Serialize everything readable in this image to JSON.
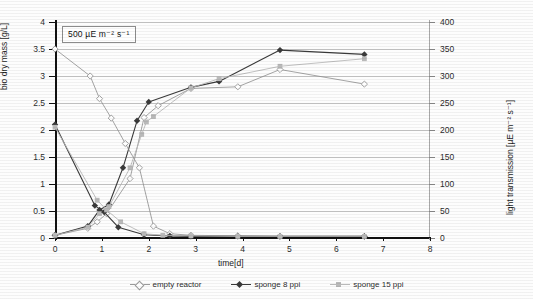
{
  "figure": {
    "annotation": "500 µE m⁻² s⁻¹",
    "annotation_value": "500",
    "annotation_unit": "µE m-2 s-1"
  },
  "axes": {
    "x": {
      "label": "time[d]",
      "min": 0,
      "max": 8,
      "step": 1,
      "ticks": [
        "0",
        "1",
        "2",
        "3",
        "4",
        "5",
        "6",
        "7",
        "8"
      ]
    },
    "y_left": {
      "label": "bio dry mass [g/L]",
      "min": 0,
      "max": 4,
      "step": 0.5,
      "ticks": [
        "0",
        "0.5",
        "1",
        "1.5",
        "2",
        "2.5",
        "3",
        "3.5",
        "4"
      ]
    },
    "y_right": {
      "label": "light transmission [µE m⁻² s⁻¹]",
      "min": 0,
      "max": 400,
      "step": 50,
      "ticks": [
        "0",
        "50",
        "100",
        "150",
        "200",
        "250",
        "300",
        "350",
        "400"
      ]
    }
  },
  "legend": {
    "position": "bottom-center",
    "items": [
      {
        "label": "empty reactor",
        "color": "#9a9a9a",
        "marker": "diamond-open"
      },
      {
        "label": "sponge 8 ppi",
        "color": "#3a3a3a",
        "marker": "diamond-filled"
      },
      {
        "label": "sponge 15 ppi",
        "color": "#b9b9b9",
        "marker": "square-light"
      }
    ]
  },
  "chart_data": {
    "type": "line",
    "title": "",
    "xlabel": "time[d]",
    "ylabel": "bio dry mass [g/L]",
    "ylabel_secondary": "light transmission [µE m⁻² s⁻¹]",
    "xlim": [
      0,
      8
    ],
    "ylim": [
      0,
      4
    ],
    "ylim_secondary": [
      0,
      400
    ],
    "grid": true,
    "annotations": [
      "500 µE m⁻² s⁻¹"
    ],
    "series": [
      {
        "name": "empty reactor — bio dry mass",
        "axis": "left",
        "color": "#9a9a9a",
        "marker": "diamond-open",
        "points": [
          [
            0.0,
            0.05
          ],
          [
            0.7,
            0.18
          ],
          [
            0.9,
            0.3
          ],
          [
            1.1,
            0.45
          ],
          [
            1.6,
            1.1
          ],
          [
            1.9,
            2.23
          ],
          [
            2.2,
            2.45
          ],
          [
            2.9,
            2.77
          ],
          [
            3.9,
            2.8
          ],
          [
            4.8,
            3.12
          ],
          [
            6.6,
            2.85
          ]
        ]
      },
      {
        "name": "sponge 8 ppi — bio dry mass",
        "axis": "left",
        "color": "#3a3a3a",
        "marker": "diamond-filled",
        "points": [
          [
            0.0,
            0.05
          ],
          [
            0.7,
            0.22
          ],
          [
            0.95,
            0.52
          ],
          [
            1.15,
            0.62
          ],
          [
            1.45,
            1.3
          ],
          [
            1.75,
            2.17
          ],
          [
            2.0,
            2.52
          ],
          [
            2.9,
            2.79
          ],
          [
            3.5,
            2.9
          ],
          [
            4.8,
            3.48
          ],
          [
            6.6,
            3.4
          ]
        ]
      },
      {
        "name": "sponge 15 ppi — bio dry mass",
        "axis": "left",
        "color": "#b9b9b9",
        "marker": "square-light",
        "points": [
          [
            0.0,
            0.05
          ],
          [
            0.7,
            0.2
          ],
          [
            0.95,
            0.45
          ],
          [
            1.15,
            0.58
          ],
          [
            1.6,
            1.3
          ],
          [
            1.85,
            1.92
          ],
          [
            1.95,
            2.15
          ],
          [
            2.1,
            2.25
          ],
          [
            2.9,
            2.78
          ],
          [
            3.5,
            2.95
          ],
          [
            4.8,
            3.18
          ],
          [
            6.6,
            3.32
          ]
        ]
      },
      {
        "name": "empty reactor — light transmission",
        "axis": "right",
        "color": "#9a9a9a",
        "marker": "diamond-open",
        "points": [
          [
            0.0,
            350
          ],
          [
            0.75,
            300
          ],
          [
            0.95,
            258
          ],
          [
            1.2,
            222
          ],
          [
            1.5,
            175
          ],
          [
            1.8,
            130
          ],
          [
            2.1,
            22
          ],
          [
            2.45,
            8
          ],
          [
            2.9,
            5
          ],
          [
            3.9,
            4
          ],
          [
            4.8,
            3
          ],
          [
            6.6,
            3
          ]
        ]
      },
      {
        "name": "sponge 8 ppi — light transmission",
        "axis": "right",
        "color": "#3a3a3a",
        "marker": "diamond-filled",
        "points": [
          [
            0.0,
            210
          ],
          [
            0.85,
            60
          ],
          [
            1.05,
            48
          ],
          [
            1.35,
            20
          ],
          [
            1.9,
            6
          ],
          [
            2.45,
            4
          ],
          [
            2.9,
            3
          ],
          [
            3.9,
            3
          ],
          [
            4.8,
            3
          ],
          [
            6.6,
            3
          ]
        ]
      },
      {
        "name": "sponge 15 ppi — light transmission",
        "axis": "right",
        "color": "#b9b9b9",
        "marker": "square-light",
        "points": [
          [
            0.0,
            205
          ],
          [
            0.9,
            70
          ],
          [
            1.1,
            52
          ],
          [
            1.4,
            30
          ],
          [
            1.9,
            8
          ],
          [
            2.3,
            5
          ],
          [
            2.9,
            4
          ],
          [
            3.9,
            3
          ],
          [
            4.8,
            3
          ],
          [
            6.6,
            3
          ]
        ]
      }
    ]
  }
}
